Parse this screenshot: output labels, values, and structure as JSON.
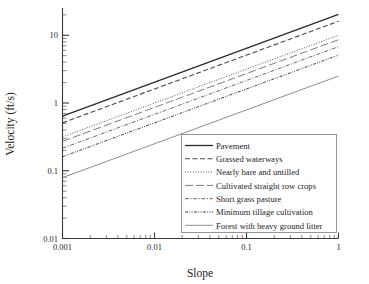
{
  "chart_data": {
    "type": "line",
    "title": "",
    "xlabel": "Slope",
    "ylabel": "Velocity (ft/s)",
    "xscale": "log",
    "yscale": "log",
    "xlim": [
      0.001,
      1
    ],
    "ylim": [
      0.01,
      20
    ],
    "grid": false,
    "legend_position": "lower right",
    "xticks": [
      "0.001",
      "0.01",
      "0.1",
      "1"
    ],
    "xtick_values": [
      0.001,
      0.01,
      0.1,
      1
    ],
    "yticks": [
      "0.01",
      "0.1",
      "1",
      "10"
    ],
    "ytick_values": [
      0.01,
      0.1,
      1,
      10
    ],
    "relation": "V = k * sqrt(S)",
    "x": [
      0.001,
      0.01,
      0.1,
      1
    ],
    "series": [
      {
        "name": "Pavement",
        "k": 20.3,
        "linestyle": "solid",
        "dash": "none",
        "color": "#2b2b2b",
        "width": 1.3,
        "values": [
          0.642,
          2.03,
          6.42,
          20.3
        ]
      },
      {
        "name": "Grassed waterways",
        "k": 16.1,
        "linestyle": "dashed",
        "dash": "5,2.5",
        "color": "#4a4a4a",
        "width": 1.1,
        "values": [
          0.509,
          1.61,
          5.09,
          16.1
        ]
      },
      {
        "name": "Nearly bare and untilled",
        "k": 10.0,
        "linestyle": "dotted",
        "dash": "1,1.6",
        "color": "#555555",
        "width": 1.0,
        "values": [
          0.316,
          1.0,
          3.16,
          10.0
        ]
      },
      {
        "name": "Cultivated straight row crops",
        "k": 8.6,
        "linestyle": "long-dash",
        "dash": "8,3",
        "color": "#7d7d7d",
        "width": 1.0,
        "values": [
          0.272,
          0.86,
          2.72,
          8.6
        ]
      },
      {
        "name": "Short grass pasture",
        "k": 6.8,
        "linestyle": "dash-dot",
        "dash": "4,1.6,1,1.6",
        "color": "#6b6b6b",
        "width": 1.0,
        "values": [
          0.215,
          0.68,
          2.15,
          6.8
        ]
      },
      {
        "name": "Minimum tillage cultivation",
        "k": 5.1,
        "linestyle": "dash-dot-dot",
        "dash": "3,1.3,1,1.3,1,1.3",
        "color": "#3f3f3f",
        "width": 1.0,
        "values": [
          0.161,
          0.51,
          1.61,
          5.1
        ]
      },
      {
        "name": "Forest with heavy ground litter",
        "k": 2.5,
        "linestyle": "solid",
        "dash": "none",
        "color": "#8e8e8e",
        "width": 1.0,
        "values": [
          0.0791,
          0.25,
          0.791,
          2.5
        ]
      }
    ]
  },
  "legend": {
    "items": [
      "Pavement",
      "Grassed waterways",
      "Nearly bare and untilled",
      "Cultivated straight row crops",
      "Short grass pasture",
      "Minimum tillage cultivation",
      "Forest with heavy ground litter"
    ]
  }
}
